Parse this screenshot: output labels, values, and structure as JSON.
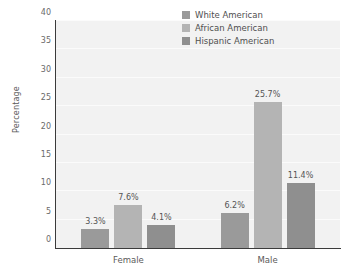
{
  "chart_data": {
    "type": "bar",
    "title": "",
    "subtitle": "",
    "xlabel": "",
    "ylabel": "Percentage",
    "categories": [
      "Female",
      "Male"
    ],
    "series": [
      {
        "name": "White American",
        "color": "#9a9a9a",
        "values": [
          3.3,
          6.2
        ],
        "labels": [
          "3.3%",
          "6.2%"
        ]
      },
      {
        "name": "African American",
        "color": "#b4b4b4",
        "values": [
          7.6,
          25.7
        ],
        "labels": [
          "7.6%",
          "25.7%"
        ]
      },
      {
        "name": "Hispanic American",
        "color": "#8f8f8f",
        "values": [
          4.1,
          11.4
        ],
        "labels": [
          "4.1%",
          "11.4%"
        ]
      }
    ],
    "ylim": [
      0,
      40
    ],
    "yticks": [
      0,
      5,
      10,
      15,
      20,
      25,
      30,
      35,
      40
    ],
    "ytick_labels": [
      "0",
      "5",
      "10",
      "15",
      "20",
      "25",
      "30",
      "35",
      "40"
    ],
    "grid": true,
    "grid_axis": "y",
    "legend_position": "top-right",
    "plot_background": "#f2f2f2",
    "axis_color": "#3b3b3b"
  }
}
